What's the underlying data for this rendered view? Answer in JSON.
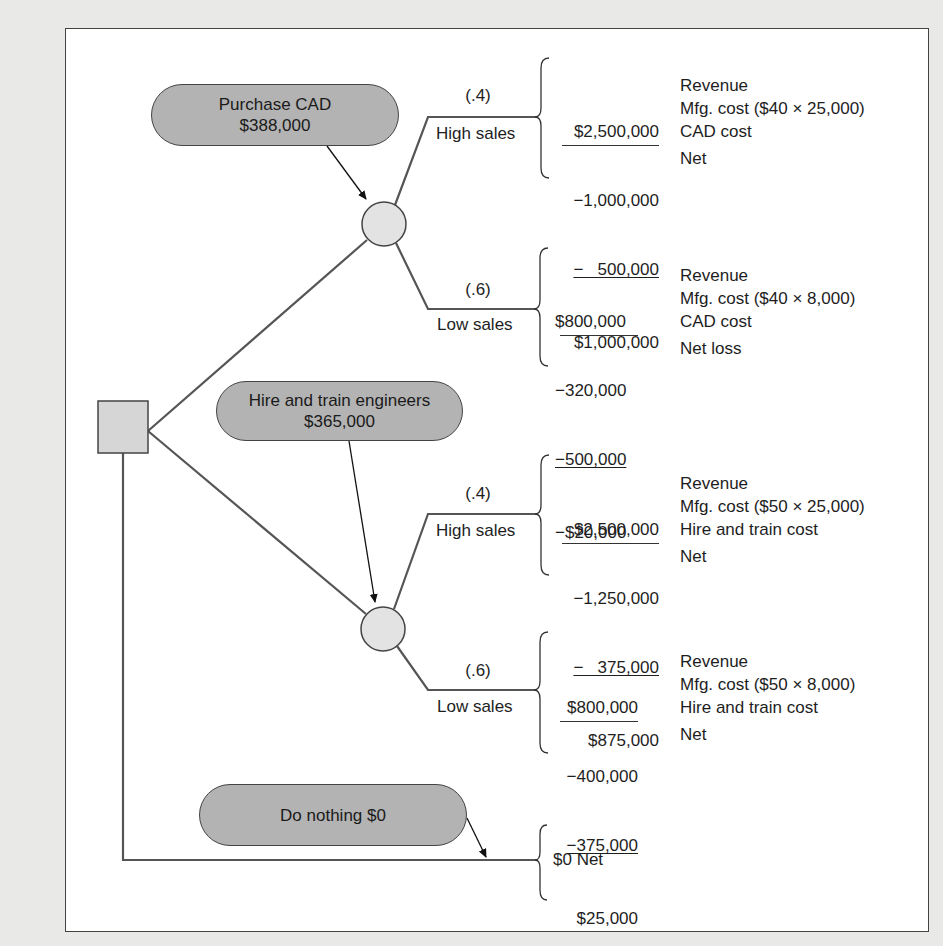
{
  "diagram": {
    "type": "decision-tree",
    "colors": {
      "background": "#e9e9e7",
      "panel": "#ffffff",
      "node_fill": "#b3b3b3",
      "chance_node_fill": "#e3e3e3",
      "line": "#555555"
    },
    "decision_node": {
      "shape": "square"
    },
    "alternatives": [
      {
        "label_line1": "Purchase CAD",
        "label_line2": "$388,000",
        "outcomes": [
          {
            "probability": "(.4)",
            "name": "High sales",
            "rows": [
              {
                "amount": "$2,500,000",
                "desc": "Revenue"
              },
              {
                "amount": "−1,000,000",
                "desc": "Mfg. cost ($40 × 25,000)"
              },
              {
                "amount": "−   500,000",
                "desc": "CAD cost"
              },
              {
                "amount": "$1,000,000",
                "desc": "Net"
              }
            ]
          },
          {
            "probability": "(.6)",
            "name": "Low sales",
            "rows": [
              {
                "amount": "$800,000",
                "desc": "Revenue"
              },
              {
                "amount": "−320,000",
                "desc": "Mfg. cost ($40 × 8,000)"
              },
              {
                "amount": "−500,000",
                "desc": "CAD cost"
              },
              {
                "amount": "−$20,000",
                "desc": "Net loss"
              }
            ]
          }
        ]
      },
      {
        "label_line1": "Hire and train engineers",
        "label_line2": "$365,000",
        "outcomes": [
          {
            "probability": "(.4)",
            "name": "High sales",
            "rows": [
              {
                "amount": "$2,500,000",
                "desc": "Revenue"
              },
              {
                "amount": "−1,250,000",
                "desc": "Mfg. cost ($50 × 25,000)"
              },
              {
                "amount": "−   375,000",
                "desc": "Hire and train cost"
              },
              {
                "amount": "$875,000",
                "desc": "Net"
              }
            ]
          },
          {
            "probability": "(.6)",
            "name": "Low sales",
            "rows": [
              {
                "amount": "$800,000",
                "desc": "Revenue"
              },
              {
                "amount": "−400,000",
                "desc": "Mfg. cost ($50 × 8,000)"
              },
              {
                "amount": "−375,000",
                "desc": "Hire and train cost"
              },
              {
                "amount": "$25,000",
                "desc": "Net"
              }
            ]
          }
        ]
      },
      {
        "label_line1": "Do nothing $0",
        "result": "$0 Net"
      }
    ]
  }
}
